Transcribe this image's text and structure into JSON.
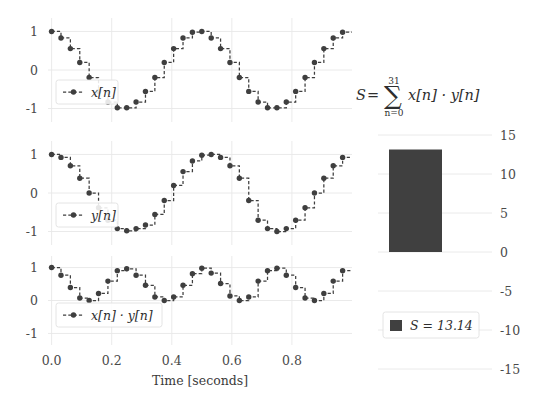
{
  "figure": {
    "background": "#ffffff",
    "line_color": "#3f3f3f",
    "bar_color": "#404040",
    "grid_color": "#e8e8e8"
  },
  "signals": {
    "xlabel": "Time [seconds]",
    "x_ticks": [
      "0.0",
      "0.2",
      "0.4",
      "0.6",
      "0.8"
    ],
    "x_tick_values": [
      0.0,
      0.2,
      0.4,
      0.6,
      0.8
    ],
    "y_ticks": [
      "1",
      "0",
      "-1"
    ],
    "y_tick_values": [
      1,
      0,
      -1
    ],
    "ylim": [
      -1.35,
      1.35
    ],
    "xlim": [
      -0.012,
      1.0
    ],
    "n_samples": 32,
    "sample_period": 0.03125,
    "panels": [
      {
        "name": "x",
        "legend": "x[n]",
        "legend_label_html": "x[n]"
      },
      {
        "name": "y",
        "legend": "y[n]",
        "legend_label_html": "y[n]"
      },
      {
        "name": "xy",
        "legend": "x[n] · y[n]",
        "legend_label_html": "x[n] · y[n]"
      }
    ]
  },
  "chart_data": {
    "type": "line",
    "title": "",
    "xlabel": "Time [seconds]",
    "ylabel": "",
    "xlim": [
      0.0,
      1.0
    ],
    "ylim": [
      -1.35,
      1.35
    ],
    "grid": true,
    "legend_position": "lower-left",
    "x": [
      0.0,
      0.03125,
      0.0625,
      0.09375,
      0.125,
      0.15625,
      0.1875,
      0.21875,
      0.25,
      0.28125,
      0.3125,
      0.34375,
      0.375,
      0.40625,
      0.4375,
      0.46875,
      0.5,
      0.53125,
      0.5625,
      0.59375,
      0.625,
      0.65625,
      0.6875,
      0.71875,
      0.75,
      0.78125,
      0.8125,
      0.84375,
      0.875,
      0.90625,
      0.9375,
      0.96875
    ],
    "series": [
      {
        "name": "x[n]",
        "values": [
          1.0,
          0.831,
          0.556,
          0.195,
          -0.195,
          -0.556,
          -0.831,
          -0.981,
          -0.981,
          -0.831,
          -0.556,
          -0.195,
          0.195,
          0.556,
          0.831,
          0.981,
          1.0,
          0.831,
          0.556,
          0.195,
          -0.195,
          -0.556,
          -0.831,
          -0.981,
          -0.981,
          -0.831,
          -0.556,
          -0.195,
          0.195,
          0.556,
          0.831,
          0.981
        ]
      },
      {
        "name": "y[n]",
        "values": [
          1.0,
          0.924,
          0.707,
          0.383,
          0.0,
          -0.383,
          -0.707,
          -0.924,
          -0.981,
          -0.924,
          -0.831,
          -0.556,
          -0.195,
          0.195,
          0.556,
          0.831,
          0.981,
          1.0,
          0.924,
          0.707,
          0.383,
          -0.195,
          -0.707,
          -0.924,
          -1.0,
          -0.924,
          -0.707,
          -0.383,
          0.0,
          0.383,
          0.707,
          0.924
        ]
      },
      {
        "name": "x[n] · y[n]",
        "values": [
          1.0,
          0.768,
          0.393,
          0.075,
          0.0,
          0.213,
          0.588,
          0.906,
          0.962,
          0.768,
          0.462,
          0.108,
          0.0,
          0.108,
          0.462,
          0.815,
          0.981,
          0.831,
          0.514,
          0.138,
          0.0,
          0.108,
          0.588,
          0.906,
          0.981,
          0.768,
          0.393,
          0.075,
          0.0,
          0.213,
          0.588,
          0.906
        ]
      }
    ]
  },
  "sum_panel": {
    "formula": {
      "S": "S",
      "equals": "=",
      "sigma": "∑",
      "upper_limit": "31",
      "lower_limit": "n=0",
      "summand": "x[n] · y[n]"
    },
    "legend_label": "S = 13.14",
    "bar_value": 13.14,
    "y_ticks": [
      "15",
      "10",
      "5",
      "0",
      "-5",
      "-10",
      "-15"
    ],
    "y_tick_values": [
      15,
      10,
      5,
      0,
      -5,
      -10,
      -15
    ],
    "ylim": [
      -15,
      15
    ],
    "bar_color": "#404040"
  },
  "sum_chart_data": {
    "type": "bar",
    "categories": [
      "S"
    ],
    "values": [
      13.14
    ],
    "title": "",
    "xlabel": "",
    "ylabel": "",
    "ylim": [
      -15,
      15
    ],
    "grid": true,
    "legend_position": "lower-center"
  }
}
